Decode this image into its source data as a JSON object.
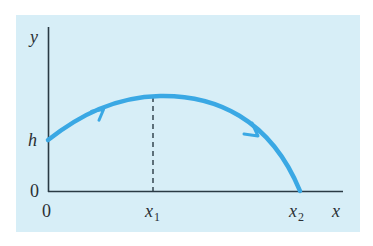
{
  "diagram": {
    "title": "",
    "axes": {
      "x_label": "x",
      "y_label": "y"
    },
    "labels": {
      "y_origin": "0",
      "x_origin": "0",
      "h": "h",
      "x1_main": "x",
      "x1_sub": "1",
      "x2_main": "x",
      "x2_sub": "2"
    },
    "curve": {
      "description": "Projectile trajectory launched from height h, rising to a maximum above x1, then falling to the ground at x2",
      "start": {
        "x": 0,
        "y": "h"
      },
      "peak_at_x": "x1",
      "lands_at_x": "x2",
      "direction_arrows": 2
    },
    "colors": {
      "panel_background": "#d7eef7",
      "curve": "#3aa8e4",
      "axes": "#2a3a44",
      "dashed_line": "#2a3a44",
      "text": "#2b3035"
    }
  }
}
